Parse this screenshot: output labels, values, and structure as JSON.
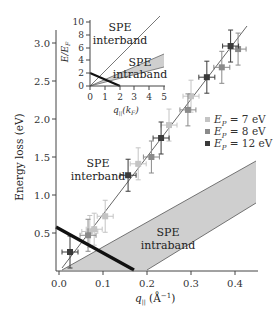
{
  "chart_data": {
    "type": "scatter",
    "title": "",
    "xlabel": "q∥ (Å⁻¹)",
    "ylabel": "Energy loss (eV)",
    "xlim": [
      0.0,
      0.45
    ],
    "ylim": [
      0.0,
      3.2
    ],
    "x_ticks": [
      "0.0",
      "0.1",
      "0.2",
      "0.3",
      "0.4"
    ],
    "y_ticks": [
      "0.5",
      "1.0",
      "1.5",
      "2.0",
      "2.5",
      "3.0"
    ],
    "grid": false,
    "legend_position": "right-middle",
    "series": [
      {
        "name": "E_P = 7 eV",
        "color": "#c4c4c4",
        "points": [
          [
            0.07,
            0.52
          ],
          [
            0.08,
            0.55
          ],
          [
            0.105,
            0.72
          ],
          [
            0.18,
            1.41
          ],
          [
            0.25,
            1.92
          ],
          [
            0.3,
            2.3
          ]
        ]
      },
      {
        "name": "E_P = 8 eV",
        "color": "#8a8a8a",
        "points": [
          [
            0.066,
            0.47
          ],
          [
            0.21,
            1.5
          ],
          [
            0.293,
            2.12
          ],
          [
            0.37,
            2.68
          ],
          [
            0.407,
            2.92
          ]
        ]
      },
      {
        "name": "E_P = 12 eV",
        "color": "#3a3a3a",
        "points": [
          [
            0.025,
            0.25
          ],
          [
            0.157,
            1.26
          ],
          [
            0.232,
            1.75
          ],
          [
            0.336,
            2.55
          ],
          [
            0.39,
            2.96
          ]
        ]
      }
    ],
    "fit_line": {
      "from": [
        0.007,
        0.04
      ],
      "to": [
        0.428,
        3.22
      ]
    },
    "boundary_line": {
      "from": [
        -0.007,
        0.58
      ],
      "to": [
        0.17,
        0.02
      ]
    },
    "intraband_region": {
      "upper_edge": [
        [
          0.007,
          0.0
        ],
        [
          0.45,
          1.45
        ]
      ],
      "lower_edge": [
        [
          0.2,
          0.0
        ],
        [
          0.45,
          0.89
        ]
      ]
    },
    "annotations": [
      {
        "text_line1": "SPE",
        "text_line2": "interband",
        "at": [
          0.08,
          1.6
        ]
      },
      {
        "text_line1": "SPE",
        "text_line2": "intraband",
        "at": [
          0.25,
          0.45
        ]
      }
    ],
    "inset": {
      "type": "line",
      "xlabel": "q∥ (k_F)",
      "ylabel": "E/E_F",
      "xlim": [
        0,
        5
      ],
      "ylim": [
        0,
        10
      ],
      "x_ticks": [
        "0",
        "1",
        "2",
        "3",
        "4",
        "5"
      ],
      "y_ticks": [
        "0",
        "2",
        "4",
        "6",
        "8",
        "10"
      ],
      "interband_line": {
        "from": [
          0,
          0
        ],
        "to": [
          5,
          11
        ]
      },
      "intraband_band": {
        "upper": [
          [
            0,
            0
          ],
          [
            5,
            5
          ]
        ],
        "lower": [
          [
            0,
            0
          ],
          [
            5,
            3
          ]
        ]
      },
      "boundary_line": {
        "from": [
          0,
          2
        ],
        "to": [
          2,
          0
        ]
      },
      "annotations": [
        {
          "text_line1": "SPE",
          "text_line2": "interband"
        },
        {
          "text_line1": "SPE",
          "text_line2": "intraband"
        }
      ]
    }
  },
  "labels": {
    "ylabel": "Energy loss (eV)",
    "xlabel_q": "q",
    "xlabel_sub": "||",
    "xlabel_unit": " (Å",
    "xlabel_exp": "−1",
    "xlabel_close": ")",
    "x_ticks": [
      "0.0",
      "0.1",
      "0.2",
      "0.3",
      "0.4"
    ],
    "y_ticks": [
      "0.5",
      "1.0",
      "1.5",
      "2.0",
      "2.5",
      "3.0"
    ],
    "spe": "SPE",
    "interband": "interband",
    "intraband": "intraband",
    "legend": [
      {
        "prefix": "E",
        "sub": "P",
        "suffix": " = 7 eV",
        "color": "#c4c4c4"
      },
      {
        "prefix": "E",
        "sub": "P",
        "suffix": " = 8 eV",
        "color": "#8a8a8a"
      },
      {
        "prefix": "E",
        "sub": "P",
        "suffix": " = 12 eV",
        "color": "#3a3a3a"
      }
    ],
    "inset": {
      "ylabel_E": "E/E",
      "ylabel_sub": "F",
      "xlabel_q": "q",
      "xlabel_sub": "||",
      "xlabel_k": "(k",
      "xlabel_ksub": "F",
      "xlabel_close": ")",
      "x_ticks": [
        "0",
        "1",
        "2",
        "3",
        "4",
        "5"
      ],
      "y_ticks": [
        "0",
        "2",
        "4",
        "6",
        "8",
        "10"
      ]
    }
  }
}
